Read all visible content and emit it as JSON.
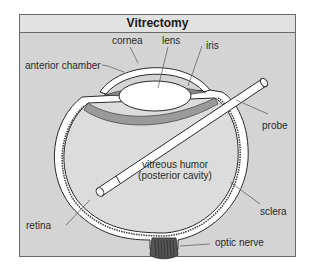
{
  "title": "Vitrectomy",
  "labels": {
    "cornea": "cornea",
    "lens": "lens",
    "iris": "iris",
    "anterior_chamber": "anterior chamber",
    "probe": "probe",
    "vitreous_line1": "vitreous humor",
    "vitreous_line2": "(posterior cavity)",
    "sclera": "sclera",
    "retina": "retina",
    "optic_nerve": "optic nerve"
  },
  "colors": {
    "background": "#d4d4d4",
    "title_bar": "#e2e2e2",
    "border": "#6a6a6a",
    "eye_fill": "#dcdcdc",
    "sclera_white": "#ffffff",
    "outline": "#2a2a2a"
  }
}
